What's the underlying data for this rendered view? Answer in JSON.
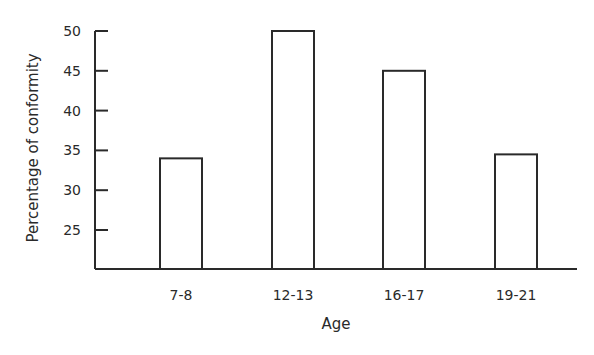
{
  "chart_data": {
    "type": "bar",
    "title": "",
    "xlabel": "Age",
    "ylabel": "Percentage of conformity",
    "categories": [
      "7-8",
      "12-13",
      "16-17",
      "19-21"
    ],
    "values": [
      34,
      50,
      45,
      34.5
    ],
    "ylim": [
      20,
      50
    ],
    "yticks": [
      25,
      30,
      35,
      40,
      45,
      50
    ],
    "grid": false,
    "legend": null,
    "bar_style": {
      "fill": "#ffffff",
      "stroke": "#2a2a2a"
    }
  },
  "axes": {
    "xlabel": "Age",
    "ylabel": "Percentage of conformity",
    "yticks": [
      {
        "label": "50",
        "value": 50
      },
      {
        "label": "45",
        "value": 45
      },
      {
        "label": "40",
        "value": 40
      },
      {
        "label": "35",
        "value": 35
      },
      {
        "label": "30",
        "value": 30
      },
      {
        "label": "25",
        "value": 25
      }
    ],
    "xticks": [
      "7-8",
      "12-13",
      "16-17",
      "19-21"
    ]
  },
  "colors": {
    "ink": "#2a2a2a",
    "background": "#ffffff"
  }
}
